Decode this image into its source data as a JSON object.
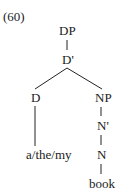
{
  "example_number": "(60)",
  "tree": {
    "nodes": {
      "dp": "DP",
      "dbar": "D'",
      "d": "D",
      "np": "NP",
      "nbar": "N'",
      "n": "N",
      "d_word": "a/the/my",
      "n_word": "book"
    },
    "edges": [
      [
        "DP",
        "D'"
      ],
      [
        "D'",
        "D"
      ],
      [
        "D'",
        "NP"
      ],
      [
        "D",
        "a/the/my"
      ],
      [
        "NP",
        "N'"
      ],
      [
        "N'",
        "N"
      ],
      [
        "N",
        "book"
      ]
    ]
  }
}
